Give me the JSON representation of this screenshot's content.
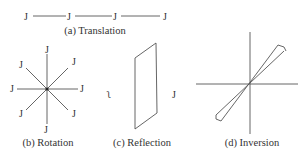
{
  "figure": {
    "panels": [
      {
        "id": "a",
        "caption": "(a) Translation",
        "glyph": "J",
        "glyph_count": 4
      },
      {
        "id": "b",
        "caption": "(b) Rotation",
        "glyph": "J",
        "glyph_count": 8
      },
      {
        "id": "c",
        "caption": "(c) Reflection",
        "glyph_left": "Ղ",
        "glyph_left_ascii": "L",
        "glyph_right": "J"
      },
      {
        "id": "d",
        "caption": "(d) Inversion",
        "glyph": "J"
      }
    ],
    "colors": {
      "line": "#555555",
      "text": "#333333",
      "background": "#ffffff"
    }
  },
  "labels": {
    "a_caption": "(a) Translation",
    "b_caption": "(b) Rotation",
    "c_caption": "(c) Reflection",
    "d_caption": "(d) Inversion",
    "j": "J",
    "mirror_j": "ʅ"
  }
}
